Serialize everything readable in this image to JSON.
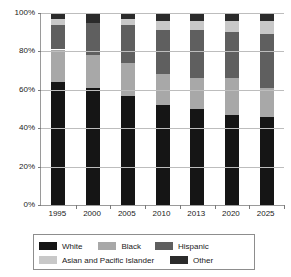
{
  "chart_data": {
    "type": "bar",
    "subtype": "stacked-100-percent",
    "title": "",
    "xlabel": "",
    "ylabel": "",
    "ylim": [
      0,
      100
    ],
    "yticks": [
      "0%",
      "20%",
      "40%",
      "60%",
      "80%",
      "100%"
    ],
    "ytick_values": [
      0,
      20,
      40,
      60,
      80,
      100
    ],
    "grid": true,
    "legend_position": "bottom",
    "stack_order_bottom_to_top": [
      "White",
      "Black",
      "Hispanic",
      "Asian and Pacific Islander",
      "Other"
    ],
    "categories": [
      "1995",
      "2000",
      "2005",
      "2010",
      "2013",
      "2020",
      "2025"
    ],
    "series": [
      {
        "name": "White",
        "color": "#151515",
        "values": [
          64,
          61,
          57,
          52,
          50,
          47,
          46
        ]
      },
      {
        "name": "Black",
        "color": "#a8a8a8",
        "values": [
          17,
          17,
          17,
          16,
          16,
          19,
          15
        ]
      },
      {
        "name": "Hispanic",
        "color": "#5f5f5f",
        "values": [
          13,
          17,
          20,
          23,
          25,
          24,
          28
        ]
      },
      {
        "name": "Asian and Pacific Islander",
        "color": "#c8c8c8",
        "values": [
          3,
          0,
          3,
          5,
          5,
          6,
          7
        ]
      },
      {
        "name": "Other",
        "color": "#2b2b2b",
        "values": [
          3,
          5,
          3,
          4,
          4,
          4,
          4
        ]
      }
    ],
    "legend_entries": [
      {
        "label": "White",
        "color": "#151515"
      },
      {
        "label": "Black",
        "color": "#a8a8a8"
      },
      {
        "label": "Hispanic",
        "color": "#5f5f5f"
      },
      {
        "label": "Asian and Pacific Islander",
        "color": "#c8c8c8"
      },
      {
        "label": "Other",
        "color": "#2b2b2b"
      }
    ]
  }
}
